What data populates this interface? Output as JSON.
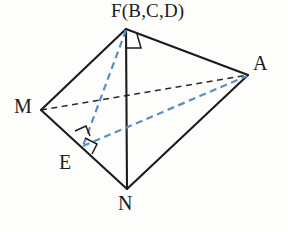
{
  "figure": {
    "background_color": "#fdfdfc",
    "stroke_color": "#1b1b1b",
    "hidden_edge_color": "#2b2b2b",
    "construction_color": "#5b8fc4",
    "labels": {
      "apex": "F(B,C,D)",
      "right": "A",
      "left": "M",
      "foot": "E",
      "bottom": "N"
    },
    "vertices": [
      {
        "name": "F",
        "label": "F(B,C,D)",
        "x": 126,
        "y": 29
      },
      {
        "name": "A",
        "label": "A",
        "x": 248,
        "y": 75
      },
      {
        "name": "M",
        "label": "M",
        "x": 41,
        "y": 110
      },
      {
        "name": "E",
        "label": "E",
        "x": 82,
        "y": 147
      },
      {
        "name": "N",
        "label": "N",
        "x": 127,
        "y": 189
      }
    ],
    "solid_edges": [
      {
        "name": "edge-M-F",
        "from": "M",
        "to": "F"
      },
      {
        "name": "edge-F-A",
        "from": "F",
        "to": "A"
      },
      {
        "name": "edge-F-N",
        "from": "F",
        "to": "N"
      },
      {
        "name": "edge-M-N",
        "from": "M",
        "to": "N"
      },
      {
        "name": "edge-N-A",
        "from": "N",
        "to": "A"
      }
    ],
    "hidden_edges": [
      {
        "name": "edge-M-A",
        "from": "M",
        "to": "A",
        "style": "dashed",
        "color": "#2b2b2b"
      }
    ],
    "construction_edges": [
      {
        "name": "edge-F-E",
        "from": "F",
        "to": "E",
        "style": "dashed",
        "color": "#5b8fc4"
      },
      {
        "name": "edge-E-A",
        "from": "E",
        "to": "A",
        "style": "dashed",
        "color": "#5b8fc4"
      }
    ],
    "right_angle_marks": [
      {
        "name": "right-angle-at-F",
        "at": "F",
        "between": [
          "F-N",
          "F-A"
        ]
      },
      {
        "name": "right-angle-at-E-upper",
        "at": "E",
        "between": [
          "E-F",
          "M-N"
        ]
      },
      {
        "name": "right-angle-at-E-lower",
        "at": "E",
        "between": [
          "E-A",
          "M-N"
        ]
      }
    ]
  }
}
